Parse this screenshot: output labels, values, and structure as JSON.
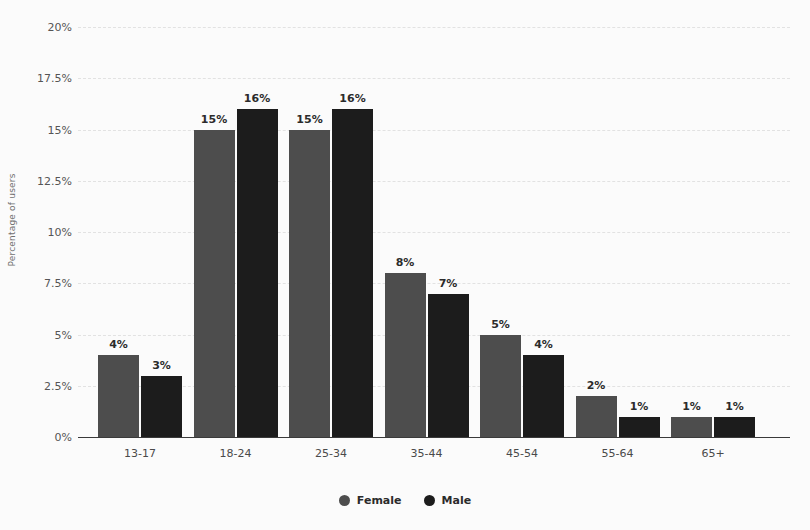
{
  "chart_data": {
    "type": "bar",
    "title": "",
    "subtitle": "",
    "xlabel": "",
    "ylabel": "Percentage of users",
    "categories": [
      "13-17",
      "18-24",
      "25-34",
      "35-44",
      "45-54",
      "55-64",
      "65+"
    ],
    "series": [
      {
        "name": "Female",
        "color": "#4d4d4d",
        "values": [
          4,
          15,
          15,
          8,
          5,
          2,
          1
        ],
        "labels": [
          "4%",
          "15%",
          "15%",
          "8%",
          "5%",
          "2%",
          "1%"
        ]
      },
      {
        "name": "Male",
        "color": "#1c1c1c",
        "values": [
          3,
          16,
          16,
          7,
          4,
          1,
          1
        ],
        "labels": [
          "3%",
          "16%",
          "16%",
          "7%",
          "4%",
          "1%",
          "1%"
        ]
      }
    ],
    "ylim": [
      0,
      20
    ],
    "ytick_values": [
      20,
      17.5,
      15,
      12.5,
      10,
      7.5,
      5,
      2.5,
      0
    ],
    "ytick_labels": [
      "20%",
      "17.5%",
      "15%",
      "12.5%",
      "10%",
      "7.5%",
      "5%",
      "2.5%",
      "0%"
    ],
    "grid": true,
    "grid_style": "dashed",
    "grid_color": "#e2e2e2",
    "legend_position": "bottom-center",
    "background_color": "#fbfbfb",
    "axis_color": "#3a3a3a"
  },
  "legend": {
    "items": [
      {
        "label": "Female",
        "color": "#4d4d4d",
        "marker": "circle-marker"
      },
      {
        "label": "Male",
        "color": "#1c1c1c",
        "marker": "circle-marker"
      }
    ]
  }
}
